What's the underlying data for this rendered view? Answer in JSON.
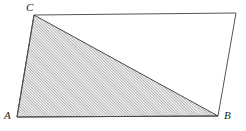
{
  "figure": {
    "type": "geometry-diagram",
    "canvas": {
      "width": 246,
      "height": 131
    },
    "background_color": "#ffffff",
    "outline_color": "#555555",
    "hatch_color": "#555555",
    "label_color": "#1a1a1a"
  },
  "labels": {
    "a": "A",
    "b": "B",
    "c": "C"
  },
  "points": {
    "A": {
      "x": 17,
      "y": 117
    },
    "B": {
      "x": 218,
      "y": 116
    },
    "C": {
      "x": 34,
      "y": 15
    },
    "D": {
      "x": 236,
      "y": 13
    }
  },
  "shapes": {
    "quadrilateral": {
      "name": "outer-quadrilateral",
      "vertices": "C,D,B,A",
      "points_str": "34,15 236,13 218,116 17,117",
      "fill": "none",
      "stroke": "#555555",
      "stroke_width": 1
    },
    "triangle": {
      "name": "shaded-triangle-abc",
      "vertices": "A,B,C",
      "points_str": "17,117 218,116 34,15",
      "fill": "url(#hatch-pattern)",
      "stroke": "#4a4a4a",
      "stroke_width": 1
    }
  },
  "hatch": {
    "angle_degrees": 45,
    "spacing_px": 2,
    "line_width": 0.9,
    "color": "#4d4d4d"
  }
}
